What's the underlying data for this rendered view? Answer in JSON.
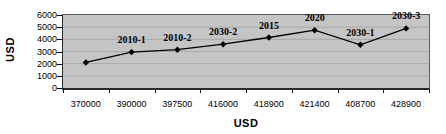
{
  "chart_data": {
    "type": "line",
    "title": "",
    "xlabel": "USD",
    "ylabel": "USD",
    "categories": [
      "370000",
      "390000",
      "397500",
      "416000",
      "418900",
      "421400",
      "408700",
      "428900"
    ],
    "series": [
      {
        "name": "USD",
        "values": [
          2100,
          2950,
          3150,
          3600,
          4150,
          4750,
          3550,
          4900
        ],
        "point_labels": [
          "",
          "2010-1",
          "2010-2",
          "2030-2",
          "2015",
          "2020",
          "2030-1",
          "2030-3"
        ]
      }
    ],
    "ylim": [
      0,
      6000
    ],
    "y_tick_step": 1000,
    "y_tick_labels": [
      "0",
      "1000",
      "2000",
      "3000",
      "4000",
      "5000",
      "6000"
    ],
    "grid": true,
    "legend_position": "none",
    "marker": "diamond",
    "colors": {
      "plot_background": "#c5c5c5",
      "gridline": "#a9a9a9",
      "line": "#000000",
      "marker": "#000000",
      "text": "#000000",
      "background": "#ffffff"
    }
  }
}
